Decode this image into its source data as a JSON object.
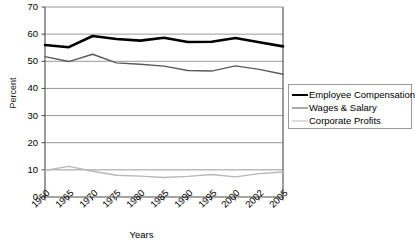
{
  "chart_data": {
    "type": "line",
    "title": "",
    "xlabel": "Years",
    "ylabel": "Percent",
    "ylim": [
      0,
      70
    ],
    "ytick_step": 10,
    "yticks": [
      0,
      10,
      20,
      30,
      40,
      50,
      60,
      70
    ],
    "grid": true,
    "legend_position": "right",
    "categories": [
      "1960",
      "1965",
      "1970",
      "1975",
      "1980",
      "1985",
      "1990",
      "1995",
      "2000",
      "2002",
      "2005"
    ],
    "series": [
      {
        "name": "Employee Compensation",
        "color": "#000000",
        "width": 2.6,
        "values": [
          56.0,
          55.2,
          59.3,
          58.2,
          57.6,
          58.7,
          57.1,
          57.2,
          58.6,
          57.0,
          55.5
        ]
      },
      {
        "name": "Wages & Salary",
        "color": "#5a5a5a",
        "width": 1.4,
        "values": [
          51.7,
          49.9,
          52.6,
          49.4,
          48.9,
          48.2,
          46.6,
          46.4,
          48.3,
          47.0,
          45.2
        ]
      },
      {
        "name": "Corporate Profits",
        "color": "#b8b8b8",
        "width": 1.4,
        "values": [
          9.8,
          11.3,
          9.5,
          8.0,
          7.7,
          7.2,
          7.6,
          8.3,
          7.4,
          8.6,
          9.2
        ]
      }
    ]
  },
  "legend": {
    "items": [
      {
        "label": "Employee Compensation"
      },
      {
        "label": "Wages & Salary"
      },
      {
        "label": "Corporate Profits"
      }
    ]
  },
  "source_note": ""
}
